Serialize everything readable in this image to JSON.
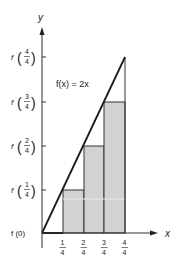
{
  "figure": {
    "function_label": "f(x) = 2x",
    "axis_x_label": "x",
    "axis_y_label": "y",
    "x_ticks": [
      {
        "num": "1",
        "den": "4"
      },
      {
        "num": "2",
        "den": "4"
      },
      {
        "num": "3",
        "den": "4"
      },
      {
        "num": "4",
        "den": "4"
      }
    ],
    "y_ticks": [
      {
        "label": "f (0)"
      },
      {
        "num": "1",
        "den": "4"
      },
      {
        "num": "2",
        "den": "4"
      },
      {
        "num": "3",
        "den": "4"
      },
      {
        "num": "4",
        "den": "4"
      }
    ],
    "y_tick_prefix": "f",
    "colors": {
      "bar_fill": "#d2d2d2",
      "line": "#1a1a1a",
      "axis": "#333333"
    },
    "rectangles": [
      {
        "x_left": "0",
        "x_right": "1/4",
        "height": "f(0)"
      },
      {
        "x_left": "1/4",
        "x_right": "2/4",
        "height": "f(1/4)"
      },
      {
        "x_left": "2/4",
        "x_right": "3/4",
        "height": "f(2/4)"
      },
      {
        "x_left": "3/4",
        "x_right": "4/4",
        "height": "f(3/4)"
      }
    ]
  }
}
